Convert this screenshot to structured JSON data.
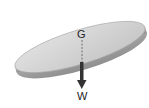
{
  "diagram": {
    "title": "",
    "labels": {
      "center_of_gravity": "G",
      "weight": "W"
    },
    "elements": [
      {
        "type": "disc",
        "description": "tilted circular disc",
        "fill": "#cfcfcf",
        "edge": "#a8a8a8"
      },
      {
        "type": "dashed-line",
        "description": "vertical line from G through disc"
      },
      {
        "type": "arrow",
        "description": "downward weight force arrow",
        "color": "#333333"
      }
    ]
  }
}
